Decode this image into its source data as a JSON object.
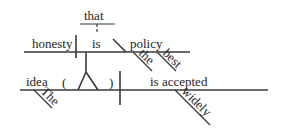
{
  "diagram": {
    "type": "Reed-Kellogg sentence diagram",
    "sentence": "The idea that honesty is the best policy is widely accepted",
    "main_clause": {
      "subject": "idea",
      "subject_modifier": "The",
      "appositive_open": "(",
      "appositive_close": ")",
      "verb": "is accepted",
      "verb_modifier": "widely"
    },
    "noun_clause": {
      "connector": "that",
      "subject": "honesty",
      "verb": "is",
      "predicate_nominative": "policy",
      "modifiers": [
        "the",
        "best"
      ]
    }
  }
}
